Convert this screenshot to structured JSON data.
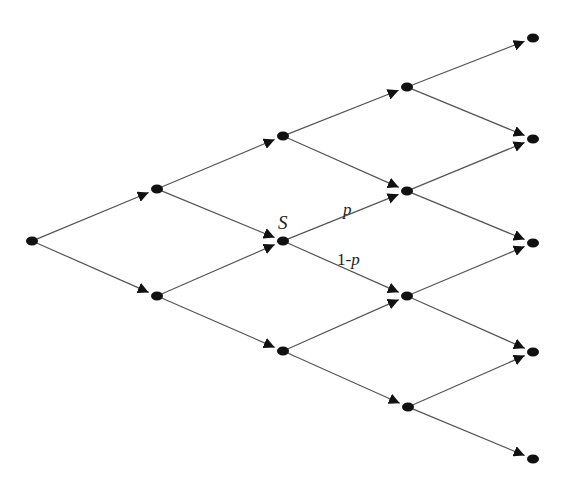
{
  "diagram": {
    "type": "recombining-binomial-tree",
    "levels": 5,
    "colors": {
      "edge": "#555555",
      "node": "#111111",
      "text": "#222222",
      "background": "#ffffff"
    },
    "nodes": [
      {
        "id": "n0_0",
        "level": 0,
        "x": 32,
        "y": 241
      },
      {
        "id": "n1_0",
        "level": 1,
        "x": 157,
        "y": 189
      },
      {
        "id": "n1_1",
        "level": 1,
        "x": 157,
        "y": 296
      },
      {
        "id": "n2_0",
        "level": 2,
        "x": 283,
        "y": 136
      },
      {
        "id": "n2_1",
        "level": 2,
        "x": 283,
        "y": 241,
        "label": "S"
      },
      {
        "id": "n2_2",
        "level": 2,
        "x": 283,
        "y": 351
      },
      {
        "id": "n3_0",
        "level": 3,
        "x": 407,
        "y": 87
      },
      {
        "id": "n3_1",
        "level": 3,
        "x": 407,
        "y": 191
      },
      {
        "id": "n3_2",
        "level": 3,
        "x": 407,
        "y": 296
      },
      {
        "id": "n3_3",
        "level": 3,
        "x": 408,
        "y": 407
      },
      {
        "id": "n4_0",
        "level": 4,
        "x": 533,
        "y": 38
      },
      {
        "id": "n4_1",
        "level": 4,
        "x": 533,
        "y": 139
      },
      {
        "id": "n4_2",
        "level": 4,
        "x": 533,
        "y": 243
      },
      {
        "id": "n4_3",
        "level": 4,
        "x": 533,
        "y": 352
      },
      {
        "id": "n4_4",
        "level": 4,
        "x": 533,
        "y": 459
      }
    ],
    "edges": [
      [
        "n0_0",
        "n1_0"
      ],
      [
        "n0_0",
        "n1_1"
      ],
      [
        "n1_0",
        "n2_0"
      ],
      [
        "n1_0",
        "n2_1"
      ],
      [
        "n1_1",
        "n2_1"
      ],
      [
        "n1_1",
        "n2_2"
      ],
      [
        "n2_0",
        "n3_0"
      ],
      [
        "n2_0",
        "n3_1"
      ],
      [
        "n2_1",
        "n3_1"
      ],
      [
        "n2_1",
        "n3_2"
      ],
      [
        "n2_2",
        "n3_2"
      ],
      [
        "n2_2",
        "n3_3"
      ],
      [
        "n3_0",
        "n4_0"
      ],
      [
        "n3_0",
        "n4_1"
      ],
      [
        "n3_1",
        "n4_1"
      ],
      [
        "n3_1",
        "n4_2"
      ],
      [
        "n3_2",
        "n4_2"
      ],
      [
        "n3_2",
        "n4_3"
      ],
      [
        "n3_3",
        "n4_3"
      ],
      [
        "n3_3",
        "n4_4"
      ]
    ],
    "labels": {
      "node_label": "S",
      "up_prob": "p",
      "down_prob_prefix": "1-",
      "down_prob_var": "p"
    }
  }
}
